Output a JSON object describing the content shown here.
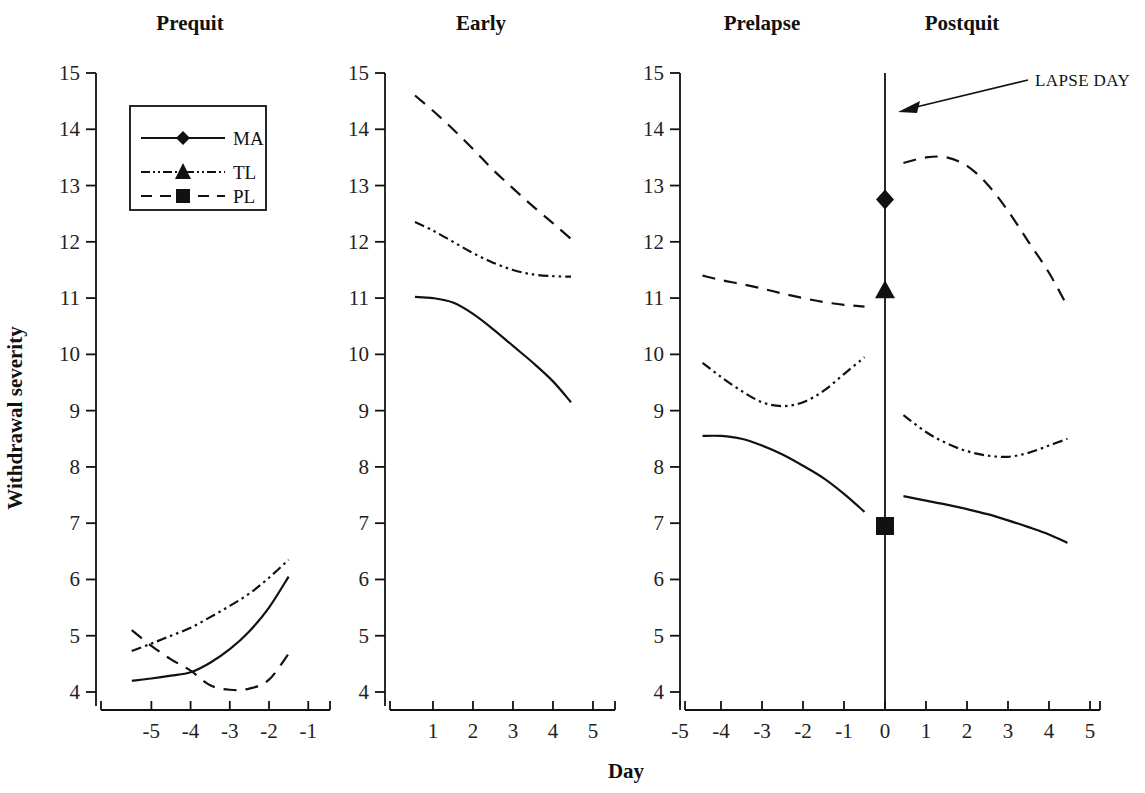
{
  "figure": {
    "y_axis_label": "Withdrawal severity",
    "x_axis_label": "Day",
    "annotation": "LAPSE DAY",
    "ink_color": "#111111",
    "background": "#ffffff"
  },
  "legend": {
    "position": "inside-panel-1-top-left",
    "entries": [
      {
        "label": "MA",
        "marker": "diamond",
        "dash": "solid"
      },
      {
        "label": "TL",
        "marker": "triangle",
        "dash": "dash-dot-dot"
      },
      {
        "label": "PL",
        "marker": "square",
        "dash": "dashed"
      }
    ]
  },
  "panels": [
    {
      "title": "Prequit",
      "xticks": [
        "-5",
        "-4",
        "-3",
        "-2",
        "-1"
      ]
    },
    {
      "title": "Early",
      "xticks": [
        "1",
        "2",
        "3",
        "4",
        "5"
      ]
    },
    {
      "title": "Prelapse",
      "xticks": [
        "-5",
        "-4",
        "-3",
        "-2",
        "-1",
        "0",
        "1",
        "2",
        "3",
        "4",
        "5"
      ]
    },
    {
      "title": "Postquit",
      "xticks": []
    }
  ],
  "yticks": [
    "15",
    "14",
    "13",
    "12",
    "11",
    "10",
    "9",
    "8",
    "7",
    "6",
    "5",
    "4"
  ],
  "chart_data": {
    "type": "line",
    "xlabel": "Day",
    "ylabel": "Withdrawal severity",
    "ylim": [
      4,
      15
    ],
    "grid": false,
    "legend_position": "upper-left of first panel",
    "legend": [
      "MA",
      "TL",
      "PL"
    ],
    "annotations": [
      {
        "text": "LAPSE DAY",
        "points_to": "vertical line at Day 0 of Prelapse/Postquit panel"
      }
    ],
    "panels": [
      {
        "name": "Prequit",
        "xlim": [
          -5.8,
          -0.7
        ],
        "xticks": [
          -5,
          -4,
          -3,
          -2,
          -1
        ],
        "series": [
          {
            "name": "MA",
            "dash": "solid",
            "x": [
              -5.5,
              -5.0,
              -4.5,
              -4.0,
              -3.5,
              -3.0,
              -2.5,
              -2.0,
              -1.5
            ],
            "y": [
              4.2,
              4.24,
              4.29,
              4.35,
              4.52,
              4.76,
              5.08,
              5.5,
              6.05
            ]
          },
          {
            "name": "TL",
            "dash": "dash-dot-dot",
            "x": [
              -5.5,
              -5.0,
              -4.5,
              -4.0,
              -3.5,
              -3.0,
              -2.5,
              -2.0,
              -1.5
            ],
            "y": [
              4.73,
              4.86,
              5.0,
              5.14,
              5.33,
              5.53,
              5.75,
              6.03,
              6.35
            ]
          },
          {
            "name": "PL",
            "dash": "dashed",
            "x": [
              -5.5,
              -5.0,
              -4.5,
              -4.0,
              -3.5,
              -3.0,
              -2.5,
              -2.0,
              -1.5
            ],
            "y": [
              5.1,
              4.82,
              4.58,
              4.38,
              4.12,
              4.04,
              4.06,
              4.22,
              4.68
            ]
          }
        ]
      },
      {
        "name": "Early",
        "xlim": [
          0.3,
          5.3
        ],
        "xticks": [
          1,
          2,
          3,
          4,
          5
        ],
        "series": [
          {
            "name": "MA",
            "dash": "solid",
            "x": [
              0.55,
              1.0,
              1.5,
              2.0,
              2.5,
              3.0,
              3.5,
              4.0,
              4.45
            ],
            "y": [
              11.02,
              11.0,
              10.92,
              10.72,
              10.45,
              10.15,
              9.85,
              9.52,
              9.15
            ]
          },
          {
            "name": "TL",
            "dash": "dash-dot-dot",
            "x": [
              0.55,
              1.0,
              1.5,
              2.0,
              2.5,
              3.0,
              3.5,
              4.0,
              4.45
            ],
            "y": [
              12.35,
              12.2,
              12.0,
              11.8,
              11.63,
              11.5,
              11.42,
              11.39,
              11.38
            ]
          },
          {
            "name": "PL",
            "dash": "dashed",
            "x": [
              0.55,
              1.0,
              1.5,
              2.0,
              2.5,
              3.0,
              3.5,
              4.0,
              4.45
            ],
            "y": [
              14.6,
              14.33,
              14.0,
              13.65,
              13.28,
              12.95,
              12.63,
              12.33,
              12.05
            ]
          }
        ]
      },
      {
        "name": "Prelapse",
        "xlim": [
          -5.0,
          0.0
        ],
        "xticks": [
          -5,
          -4,
          -3,
          -2,
          -1,
          0
        ],
        "lapse_line_x": 0,
        "series": [
          {
            "name": "MA",
            "dash": "solid",
            "x": [
              -4.45,
              -4.0,
              -3.5,
              -3.0,
              -2.5,
              -2.0,
              -1.5,
              -1.0,
              -0.5
            ],
            "y": [
              8.55,
              8.55,
              8.5,
              8.38,
              8.22,
              8.02,
              7.8,
              7.52,
              7.2
            ]
          },
          {
            "name": "TL",
            "dash": "dash-dot-dot",
            "x": [
              -4.45,
              -4.0,
              -3.5,
              -3.0,
              -2.5,
              -2.0,
              -1.5,
              -1.0,
              -0.5
            ],
            "y": [
              9.85,
              9.6,
              9.35,
              9.15,
              9.08,
              9.15,
              9.35,
              9.65,
              9.95
            ]
          },
          {
            "name": "PL",
            "dash": "dashed",
            "x": [
              -4.45,
              -4.0,
              -3.5,
              -3.0,
              -2.5,
              -2.0,
              -1.5,
              -1.0,
              -0.5
            ],
            "y": [
              11.4,
              11.32,
              11.25,
              11.17,
              11.08,
              11.0,
              10.93,
              10.88,
              10.85
            ]
          }
        ],
        "lapse_day_markers": [
          {
            "name": "MA",
            "marker": "diamond",
            "x": 0,
            "y": 12.75
          },
          {
            "name": "TL",
            "marker": "triangle",
            "x": 0,
            "y": 11.12
          },
          {
            "name": "PL",
            "marker": "square",
            "x": 0,
            "y": 6.95
          }
        ]
      },
      {
        "name": "Postquit",
        "xlim": [
          0.0,
          5.0
        ],
        "xticks": [
          0,
          1,
          2,
          3,
          4,
          5
        ],
        "series": [
          {
            "name": "MA",
            "dash": "solid",
            "x": [
              0.45,
              1.0,
              1.5,
              2.0,
              2.5,
              3.0,
              3.5,
              4.0,
              4.45
            ],
            "y": [
              7.48,
              7.4,
              7.33,
              7.25,
              7.16,
              7.05,
              6.93,
              6.8,
              6.65
            ]
          },
          {
            "name": "TL",
            "dash": "dash-dot-dot",
            "x": [
              0.45,
              1.0,
              1.5,
              2.0,
              2.5,
              3.0,
              3.5,
              4.0,
              4.45
            ],
            "y": [
              8.92,
              8.62,
              8.42,
              8.28,
              8.2,
              8.18,
              8.25,
              8.38,
              8.5
            ]
          },
          {
            "name": "PL",
            "dash": "dashed",
            "x": [
              0.45,
              1.0,
              1.5,
              2.0,
              2.5,
              3.0,
              3.5,
              4.0,
              4.45
            ],
            "y": [
              13.4,
              13.5,
              13.5,
              13.35,
              13.02,
              12.55,
              12.0,
              11.45,
              10.85
            ]
          }
        ]
      }
    ]
  }
}
